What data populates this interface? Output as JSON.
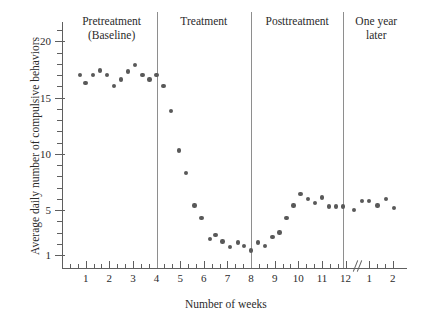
{
  "chart_data": {
    "type": "scatter",
    "title": "",
    "xlabel": "Number of weeks",
    "ylabel": "Average daily number of compulsive behaviors",
    "xlim": [
      0,
      14.6
    ],
    "ylim": [
      1,
      21
    ],
    "grid": false,
    "legend": "none",
    "y_ticks_major": [
      1,
      5,
      10,
      15,
      20
    ],
    "y_ticks_minor": [
      2,
      3,
      4,
      6,
      7,
      8,
      9,
      11,
      12,
      13,
      14,
      16,
      17,
      18,
      19,
      21
    ],
    "x_ticks_major": [
      1,
      2,
      3,
      4,
      5,
      6,
      7,
      8,
      9,
      10,
      11,
      12,
      13,
      14
    ],
    "x_tick_labels": [
      "1",
      "2",
      "3",
      "4",
      "5",
      "6",
      "7",
      "8",
      "9",
      "10",
      "11",
      "12",
      "1",
      "2"
    ],
    "axis_break_after": 12,
    "point_color": "#595959",
    "axis_color": "#5f5f5f",
    "divider_color": "#8e8e8e",
    "phases": [
      {
        "name": "pretreatment",
        "label": "Pretreatment\n(Baseline)",
        "x_start": 0.2,
        "x_end": 4.0,
        "label_x": 2.1,
        "label_y_px": 14
      },
      {
        "name": "treatment",
        "label": "Treatment",
        "x_start": 4.0,
        "x_end": 8.0,
        "label_x": 6.0,
        "label_y_px": 14
      },
      {
        "name": "posttreatment",
        "label": "Posttreatment",
        "x_start": 8.0,
        "x_end": 11.9,
        "label_x": 9.95,
        "label_y_px": 14
      },
      {
        "name": "one-year-later",
        "label": "One year\nlater",
        "x_start": 11.9,
        "x_end": 14.6,
        "label_x": 13.3,
        "label_y_px": 14
      }
    ],
    "dividers_x": [
      4.0,
      8.0,
      11.9
    ],
    "points": [
      {
        "x": 0.75,
        "y": 17.0
      },
      {
        "x": 1.0,
        "y": 16.3
      },
      {
        "x": 1.3,
        "y": 17.0
      },
      {
        "x": 1.6,
        "y": 17.4
      },
      {
        "x": 1.9,
        "y": 17.0
      },
      {
        "x": 2.2,
        "y": 16.0
      },
      {
        "x": 2.5,
        "y": 16.6
      },
      {
        "x": 2.8,
        "y": 17.3
      },
      {
        "x": 3.1,
        "y": 17.9
      },
      {
        "x": 3.4,
        "y": 17.0
      },
      {
        "x": 3.7,
        "y": 16.6
      },
      {
        "x": 4.0,
        "y": 17.0
      },
      {
        "x": 4.3,
        "y": 16.0
      },
      {
        "x": 4.6,
        "y": 13.8
      },
      {
        "x": 4.95,
        "y": 10.3
      },
      {
        "x": 5.25,
        "y": 8.3
      },
      {
        "x": 5.6,
        "y": 5.4
      },
      {
        "x": 5.9,
        "y": 4.3
      },
      {
        "x": 6.25,
        "y": 2.4
      },
      {
        "x": 6.5,
        "y": 2.8
      },
      {
        "x": 6.8,
        "y": 2.2
      },
      {
        "x": 7.1,
        "y": 1.7
      },
      {
        "x": 7.45,
        "y": 2.1
      },
      {
        "x": 7.7,
        "y": 1.8
      },
      {
        "x": 8.0,
        "y": 1.4
      },
      {
        "x": 8.3,
        "y": 2.1
      },
      {
        "x": 8.6,
        "y": 1.8
      },
      {
        "x": 8.9,
        "y": 2.6
      },
      {
        "x": 9.2,
        "y": 3.0
      },
      {
        "x": 9.5,
        "y": 4.3
      },
      {
        "x": 9.8,
        "y": 5.4
      },
      {
        "x": 10.1,
        "y": 6.4
      },
      {
        "x": 10.4,
        "y": 6.0
      },
      {
        "x": 10.7,
        "y": 5.6
      },
      {
        "x": 11.0,
        "y": 6.1
      },
      {
        "x": 11.3,
        "y": 5.3
      },
      {
        "x": 11.6,
        "y": 5.3
      },
      {
        "x": 11.9,
        "y": 5.3
      },
      {
        "x": 12.35,
        "y": 5.0
      },
      {
        "x": 12.7,
        "y": 5.8
      },
      {
        "x": 13.0,
        "y": 5.8
      },
      {
        "x": 13.35,
        "y": 5.4
      },
      {
        "x": 13.7,
        "y": 6.0
      },
      {
        "x": 14.05,
        "y": 5.2
      }
    ]
  }
}
